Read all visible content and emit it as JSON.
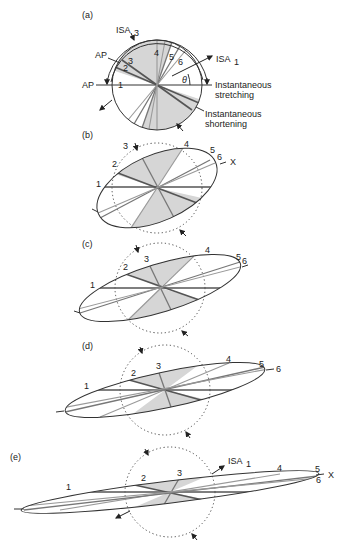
{
  "figure": {
    "colors": {
      "shade": "#d6d6d6",
      "line_dark": "#555555",
      "line_light": "#999999",
      "outline": "#333333",
      "background": "#ffffff"
    },
    "panels": [
      {
        "id": "a",
        "label": "(a)",
        "shape": "circle",
        "annotations": {
          "isa3": "ISA",
          "isa3_sub": "3",
          "isa1": "ISA",
          "isa1_sub": "1",
          "ap_upper": "AP",
          "ap_left": "AP",
          "theta": "θ",
          "stretching_line1": "Instantaneous",
          "stretching_line2": "stretching",
          "shortening_line1": "Instantaneous",
          "shortening_line2": "shortening"
        },
        "line_labels": [
          "1",
          "2",
          "3",
          "4",
          "5",
          "6"
        ]
      },
      {
        "id": "b",
        "label": "(b)",
        "shape": "ellipse",
        "line_labels": [
          "1",
          "2",
          "3",
          "4",
          "5",
          "6"
        ],
        "axis_label": "X"
      },
      {
        "id": "c",
        "label": "(c)",
        "shape": "ellipse",
        "line_labels": [
          "1",
          "2",
          "3",
          "4",
          "5",
          "6"
        ]
      },
      {
        "id": "d",
        "label": "(d)",
        "shape": "ellipse",
        "line_labels": [
          "1",
          "2",
          "3",
          "4",
          "5",
          "6"
        ]
      },
      {
        "id": "e",
        "label": "(e)",
        "shape": "ellipse",
        "line_labels": [
          "1",
          "2",
          "3",
          "4",
          "5",
          "6"
        ],
        "axis_label": "X",
        "annotations": {
          "isa1": "ISA",
          "isa1_sub": "1"
        }
      }
    ]
  }
}
